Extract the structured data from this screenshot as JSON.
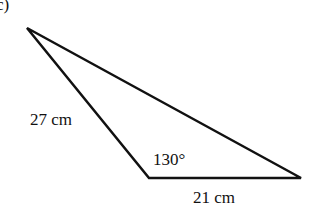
{
  "figure": {
    "part_label": "c)",
    "side_left": "27 cm",
    "side_bottom": "21 cm",
    "angle": "130°",
    "stroke_color": "#111111"
  }
}
